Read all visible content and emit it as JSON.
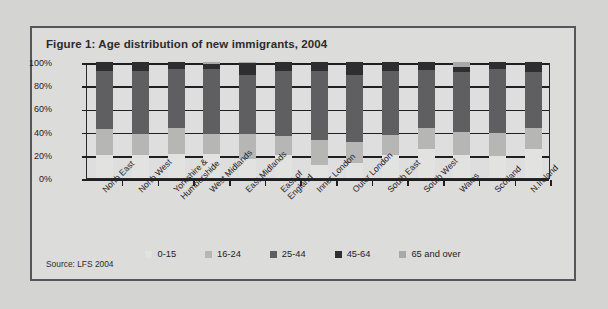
{
  "figure": {
    "title": "Figure 1: Age distribution of new immigrants, 2004",
    "source": "Source: LFS 2004"
  },
  "legend": {
    "items": [
      {
        "label": "0-15",
        "color": "#e2e2e0",
        "swatch_name": "legend-swatch-0-15"
      },
      {
        "label": "16-24",
        "color": "#b6b6b4",
        "swatch_name": "legend-swatch-16-24"
      },
      {
        "label": "25-44",
        "color": "#5f5f61",
        "swatch_name": "legend-swatch-25-44"
      },
      {
        "label": "45-64",
        "color": "#2e2e30",
        "swatch_name": "legend-swatch-45-64"
      },
      {
        "label": "65 and over",
        "color": "#a9a9a7",
        "swatch_name": "legend-swatch-65-and-over"
      }
    ]
  },
  "chart_data": {
    "type": "bar",
    "stacked": true,
    "orientation": "vertical",
    "title": "Figure 1: Age distribution of new immigrants, 2004",
    "xlabel": "",
    "ylabel": "",
    "ylim": [
      0,
      100
    ],
    "yticks": [
      "0%",
      "20%",
      "40%",
      "60%",
      "80%",
      "100%"
    ],
    "ytick_values": [
      0,
      20,
      40,
      60,
      80,
      100
    ],
    "grid": true,
    "legend_position": "bottom",
    "units": "percent",
    "categories": [
      "North East",
      "North West",
      "Yorkshire &\nHumbershide",
      "West Midlands",
      "East Midlands",
      "East of\nEngland",
      "Inner London",
      "Outer London",
      "South East",
      "South West",
      "Wales",
      "Scotland",
      "N.Ireland"
    ],
    "series": [
      {
        "name": "0-15",
        "color": "#e2e2e0",
        "values": [
          20,
          20,
          21,
          21,
          16,
          20,
          11,
          13,
          20,
          25,
          20,
          19,
          25
        ]
      },
      {
        "name": "16-24",
        "color": "#b6b6b4",
        "values": [
          22,
          18,
          22,
          17,
          22,
          16,
          22,
          18,
          17,
          18,
          20,
          20,
          18
        ]
      },
      {
        "name": "25-44",
        "color": "#5f5f61",
        "values": [
          50,
          54,
          51,
          56,
          51,
          56,
          59,
          58,
          55,
          50,
          51,
          55,
          48
        ]
      },
      {
        "name": "45-64",
        "color": "#2e2e30",
        "values": [
          8,
          8,
          6,
          4,
          10,
          8,
          8,
          11,
          8,
          7,
          5,
          6,
          9
        ]
      },
      {
        "name": "65 and over",
        "color": "#a9a9a7",
        "values": [
          0,
          0,
          0,
          2,
          1,
          0,
          0,
          0,
          0,
          0,
          4,
          0,
          0
        ]
      }
    ]
  }
}
